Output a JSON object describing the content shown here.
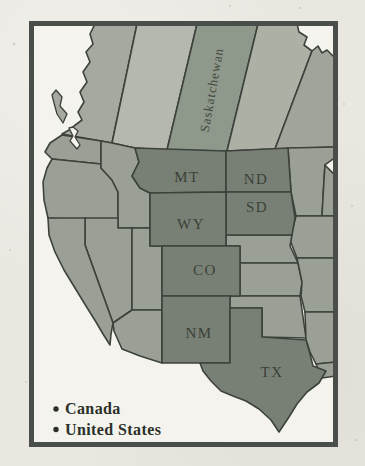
{
  "map": {
    "region_labels": {
      "saskatchewan": "Saskatchewan",
      "montana": "MT",
      "north_dakota": "ND",
      "south_dakota": "SD",
      "wyoming": "WY",
      "colorado": "CO",
      "new_mexico": "NM",
      "texas": "TX"
    },
    "legend": {
      "items": [
        {
          "label": "Canada"
        },
        {
          "label": "United States"
        }
      ]
    },
    "colors": {
      "page_background": "#e9e7e0",
      "frame_border": "#4a4e4a",
      "water": "#f4f3ee",
      "british_columbia": "#a5a99f",
      "alberta": "#b5b8ae",
      "saskatchewan": "#8f998b",
      "manitoba": "#acb0a5",
      "ontario": "#a0a49a",
      "us_state": "#9aa095",
      "us_highlight": "#788076",
      "state_border": "#3d423c",
      "label_text": "#3c4138",
      "legend_text": "#2b302a"
    }
  }
}
